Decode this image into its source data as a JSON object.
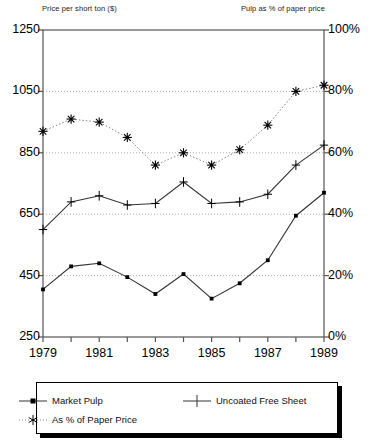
{
  "chart_data": {
    "type": "line",
    "title": "",
    "left_axis_title": "Price per short ton ($)",
    "right_axis_title": "Pulp as % of paper price",
    "xlabel": "",
    "ylabel": "Price per short ton ($)",
    "y2label": "Pulp as % of paper price",
    "grid": true,
    "legend_position": "bottom",
    "x": [
      1979,
      1980,
      1981,
      1982,
      1983,
      1984,
      1985,
      1986,
      1987,
      1988,
      1989
    ],
    "categories": [
      "1979",
      "1980",
      "1981",
      "1982",
      "1983",
      "1984",
      "1985",
      "1986",
      "1987",
      "1988",
      "1989"
    ],
    "xticklabels": [
      "1979",
      "",
      "1981",
      "",
      "1983",
      "",
      "1985",
      "",
      "1987",
      "",
      "1989"
    ],
    "xlim": [
      1979,
      1989
    ],
    "ylim": [
      250,
      1250
    ],
    "yticklabels": [
      "250",
      "450",
      "650",
      "850",
      "1050",
      "1250"
    ],
    "yticks": [
      250,
      450,
      650,
      850,
      1050,
      1250
    ],
    "y2lim": [
      0,
      100
    ],
    "y2ticklabels": [
      "0%",
      "20%",
      "40%",
      "60%",
      "80%",
      "100%"
    ],
    "y2ticks": [
      0,
      20,
      40,
      60,
      80,
      100
    ],
    "series": [
      {
        "name": "Market Pulp",
        "marker": "square-dot",
        "axis": "left",
        "linestyle": "solid",
        "values": [
          405,
          480,
          490,
          445,
          390,
          455,
          375,
          425,
          500,
          645,
          720
        ]
      },
      {
        "name": "Uncoated Free Sheet",
        "marker": "plus",
        "axis": "left",
        "linestyle": "solid",
        "values": [
          600,
          690,
          710,
          680,
          685,
          755,
          685,
          690,
          715,
          810,
          875
        ]
      },
      {
        "name": "As % of Paper Price",
        "marker": "asterisk",
        "axis": "right",
        "linestyle": "dotted",
        "values": [
          67,
          71,
          70,
          65,
          56,
          60,
          56,
          61,
          69,
          80,
          82
        ]
      }
    ]
  },
  "legend": {
    "items": [
      {
        "label": "Market Pulp",
        "marker": "square-dot"
      },
      {
        "label": "Uncoated Free Sheet",
        "marker": "plus"
      },
      {
        "label": "As % of Paper Price",
        "marker": "asterisk"
      }
    ]
  },
  "colors": {
    "line": "#333333",
    "grid": "#999999",
    "axis": "#555555",
    "text": "#000000",
    "background": "#ffffff"
  }
}
